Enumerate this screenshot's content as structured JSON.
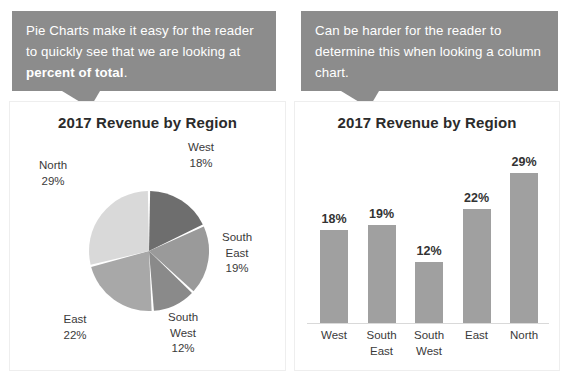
{
  "callouts": {
    "left": {
      "text_before": "Pie Charts make it easy for the reader to quickly see that we are looking at ",
      "text_bold": "percent of total",
      "text_after": "."
    },
    "right": {
      "text": "Can be harder for the reader to determine this when looking a column chart."
    },
    "background_color": "#8c8c8c",
    "text_color": "#ffffff"
  },
  "pie_panel": {
    "title": "2017 Revenue by Region"
  },
  "column_panel": {
    "title": "2017 Revenue by Region"
  },
  "chart_data": [
    {
      "type": "pie",
      "title": "2017 Revenue by Region",
      "categories": [
        "West",
        "South East",
        "South West",
        "East",
        "North"
      ],
      "values": [
        18,
        19,
        12,
        22,
        29
      ],
      "value_labels": [
        "18%",
        "19%",
        "12%",
        "22%",
        "29%"
      ],
      "unit": "percent",
      "slice_colors": [
        "#6e6e6e",
        "#9a9a9a",
        "#8a8a8a",
        "#a8a8a8",
        "#d9d9d9"
      ],
      "labels": [
        {
          "name": "West",
          "value": "18%",
          "text": "West\n18%"
        },
        {
          "name": "South East",
          "value": "19%",
          "text": "South\nEast\n19%"
        },
        {
          "name": "South West",
          "value": "12%",
          "text": "South\nWest\n12%"
        },
        {
          "name": "East",
          "value": "22%",
          "text": "East\n22%"
        },
        {
          "name": "North",
          "value": "29%",
          "text": "North\n29%"
        }
      ],
      "start_angle_deg": 0,
      "direction": "clockwise",
      "legend": "none",
      "grid": false
    },
    {
      "type": "bar",
      "title": "2017 Revenue by Region",
      "categories": [
        "West",
        "South East",
        "South West",
        "East",
        "North"
      ],
      "category_labels": [
        "West",
        "South\nEast",
        "South\nWest",
        "East",
        "North"
      ],
      "values": [
        18,
        19,
        12,
        22,
        29
      ],
      "data_labels": [
        "18%",
        "19%",
        "12%",
        "22%",
        "29%"
      ],
      "xlabel": "",
      "ylabel": "",
      "ylim": [
        0,
        33
      ],
      "unit": "percent",
      "bar_color": "#a0a0a0",
      "grid": false,
      "legend": "none"
    }
  ]
}
